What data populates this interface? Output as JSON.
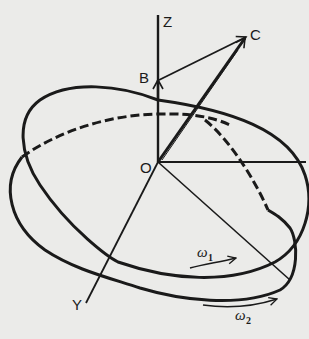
{
  "diagram": {
    "type": "vector-rotation-diagram",
    "points": {
      "origin": {
        "label": "O"
      },
      "b": {
        "label": "B"
      },
      "c": {
        "label": "C"
      }
    },
    "axes": {
      "z": {
        "label": "Z"
      },
      "y": {
        "label": "Y"
      }
    },
    "angular_velocities": [
      {
        "symbol": "ω",
        "subscript": "1"
      },
      {
        "symbol": "ω",
        "subscript": "2"
      }
    ],
    "colors": {
      "ink": "#1a1a1a",
      "paper": "#ebebe9"
    }
  }
}
